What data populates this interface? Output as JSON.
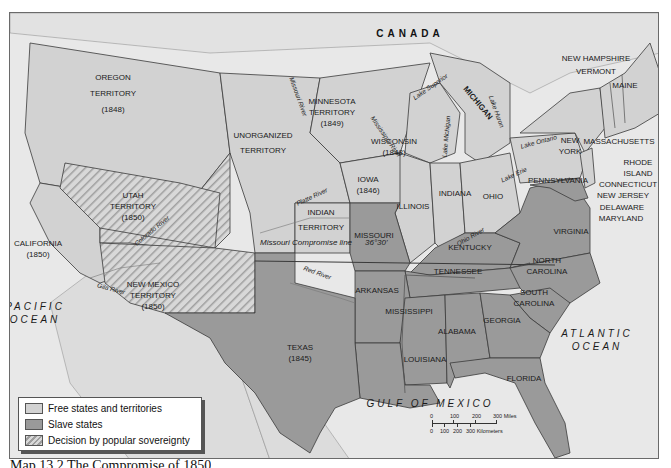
{
  "colors": {
    "water": "#e8e8e8",
    "free": "#d2d2d2",
    "slave": "#9a9a9a",
    "popular_sovereignty_stripe": "#9e9e9e",
    "foreign_land": "#dcdcdc",
    "border": "#3a3a3a"
  },
  "countries": {
    "canada": "CANADA",
    "mexico": "MEXICO"
  },
  "oceans": {
    "pacific": [
      "PACIFIC",
      "OCEAN"
    ],
    "atlantic": [
      "ATLANTIC",
      "OCEAN"
    ],
    "gulf": "GULF OF MEXICO"
  },
  "regions": {
    "oregon": [
      "OREGON",
      "TERRITORY",
      "(1848)"
    ],
    "unorganized": [
      "UNORGANIZED",
      "TERRITORY"
    ],
    "minnesota": [
      "MINNESOTA",
      "TERRITORY",
      "(1849)"
    ],
    "wisconsin": [
      "WISCONSIN",
      "(1848)"
    ],
    "michigan": "MICHIGAN",
    "iowa": [
      "IOWA",
      "(1846)"
    ],
    "utah": [
      "UTAH",
      "TERRITORY",
      "(1850)"
    ],
    "california": [
      "CALIFORNIA",
      "(1850)"
    ],
    "new_mexico": [
      "NEW MEXICO",
      "TERRITORY",
      "(1850)"
    ],
    "indian": [
      "INDIAN",
      "TERRITORY"
    ],
    "illinois": "ILLINOIS",
    "indiana": "INDIANA",
    "ohio": "OHIO",
    "pennsylvania": "PENNSYLVANIA",
    "new_york": [
      "NEW",
      "YORK"
    ],
    "maine": "MAINE",
    "new_hampshire": "NEW HAMPSHIRE",
    "vermont": "VERMONT",
    "massachusetts": "MASSACHUSETTS",
    "rhode_island": [
      "RHODE",
      "ISLAND"
    ],
    "connecticut": "CONNECTICUT",
    "new_jersey": "NEW JERSEY",
    "delaware": "DELAWARE",
    "maryland": "MARYLAND",
    "missouri": "MISSOURI",
    "kentucky": "KENTUCKY",
    "virginia": "VIRGINIA",
    "tennessee": "TENNESSEE",
    "north_carolina": [
      "NORTH",
      "CAROLINA"
    ],
    "south_carolina": [
      "SOUTH",
      "CAROLINA"
    ],
    "arkansas": "ARKANSAS",
    "mississippi": "MISSISSIPPI",
    "alabama": "ALABAMA",
    "georgia": "GEORGIA",
    "louisiana": "LOUISIANA",
    "florida": "FLORIDA",
    "texas": [
      "TEXAS",
      "(1845)"
    ]
  },
  "rivers": {
    "missouri": "Missouri River",
    "mississippi": "Mississippi River",
    "platte": "Platte River",
    "red": "Red River",
    "colorado": "Colorado River",
    "gila": "Gila River",
    "ohio": "Ohio River"
  },
  "lakes": {
    "superior": "Lake Superior",
    "michigan": "Lake Michigan",
    "huron": "Lake Huron",
    "erie": "Lake Erie",
    "ontario": "Lake Ontario"
  },
  "compromise_line": {
    "label": "Missouri Compromise line",
    "latitude": "36°30'"
  },
  "legend": {
    "items": [
      {
        "label": "Free states and territories",
        "type": "free"
      },
      {
        "label": "Slave states",
        "type": "slave"
      },
      {
        "label": "Decision by popular sovereignty",
        "type": "popular"
      }
    ]
  },
  "scale": {
    "miles_ticks": [
      "0",
      "100",
      "200",
      "300 Miles"
    ],
    "km_ticks": [
      "0",
      "100",
      "200",
      "300 Kilometers"
    ]
  },
  "caption": "Map 13.2  The Compromise of 1850"
}
